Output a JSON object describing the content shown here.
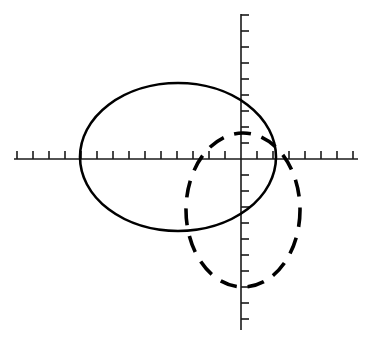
{
  "figure": {
    "title": "",
    "background_color": "#ffffff",
    "width": 372,
    "height": 343,
    "ink_color": "#000000",
    "axis_color": "#1a1a1a"
  },
  "chart_data": {
    "type": "scatter",
    "title": "",
    "subtitle": "",
    "xlabel": "",
    "ylabel": "",
    "grid": false,
    "legend_position": "none",
    "axes": {
      "origin_px": [
        241,
        159
      ],
      "x_axis": {
        "y_px": 159,
        "start_px": 14,
        "end_px": 358,
        "tick_spacing_px": 16,
        "tick_length_px": 8,
        "tick_direction": "up",
        "tick_labels": [],
        "ticks_negative_count": 14,
        "ticks_positive_count": 7,
        "xlim_units": [
          -14,
          7
        ]
      },
      "y_axis": {
        "x_px": 241,
        "start_px": 14,
        "end_px": 330,
        "tick_spacing_px": 16,
        "tick_length_px": 8,
        "tick_direction": "right",
        "tick_labels": [],
        "ticks_positive_count": 9,
        "ticks_negative_count": 10,
        "ylim_units": [
          -10,
          9
        ]
      }
    },
    "series": [
      {
        "name": "solid-ellipse",
        "shape": "ellipse",
        "linestyle": "solid",
        "color": "#000000",
        "stroke_width": 2.6,
        "center_px": [
          178,
          157
        ],
        "radius_x_px": 98,
        "radius_y_px": 74,
        "center_units": [
          -3.9,
          0.1
        ],
        "radius_x_units": 6.1,
        "radius_y_units": 4.6,
        "bbox_px": [
          80,
          83,
          276,
          231
        ]
      },
      {
        "name": "dashed-ellipse",
        "shape": "ellipse",
        "linestyle": "dashed",
        "dash_pattern_px": [
          17,
          11
        ],
        "color": "#000000",
        "stroke_width": 3.6,
        "center_px": [
          243,
          210
        ],
        "radius_x_px": 57,
        "radius_y_px": 77,
        "center_units": [
          0.1,
          -3.2
        ],
        "radius_x_units": 3.6,
        "radius_y_units": 4.8,
        "bbox_px": [
          186,
          133,
          300,
          287
        ]
      }
    ]
  }
}
